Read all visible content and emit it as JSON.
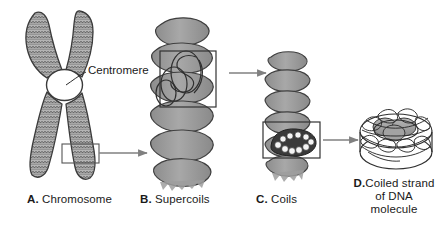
{
  "figure": {
    "background_color": "#ffffff",
    "ink_color": "#1a1a1a",
    "fill_gray": "#9d9d9d",
    "fill_light": "#c9c9c9",
    "arrow_color": "#808080",
    "box_color": "#555555"
  },
  "annotations": {
    "centromere": "Centromere"
  },
  "panels": [
    {
      "key": "A.",
      "label": "Chromosome",
      "caption": "A. Chromosome"
    },
    {
      "key": "B.",
      "label": "Supercoils",
      "caption": "B. Supercoils"
    },
    {
      "key": "C.",
      "label": "Coils",
      "caption": "C. Coils"
    },
    {
      "key": "D.",
      "label_line1": "Coiled strand",
      "label_line2": "of DNA",
      "label_line3": "molecule",
      "caption": "D. Coiled strand of DNA molecule"
    }
  ],
  "arrows": [
    {
      "name": "arrow-chromosome-to-supercoils"
    },
    {
      "name": "arrow-supercoils-to-coils"
    },
    {
      "name": "arrow-coils-to-dna"
    }
  ],
  "callout_boxes": [
    {
      "name": "callout-box-chromosome-arm"
    },
    {
      "name": "callout-box-supercoil"
    },
    {
      "name": "callout-box-coil"
    }
  ]
}
